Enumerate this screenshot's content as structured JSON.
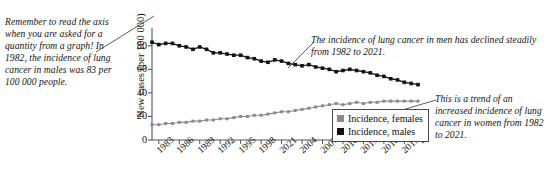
{
  "annotations": {
    "left_note": "Remember to read the axis when you are asked for a quantity from a graph! In 1982, the incidence of lung cancer in males was 83 per 100 000 people.",
    "men_note": "The incidence of lung cancer in men has declined steadily from 1982 to 2021.",
    "women_note": "This is a trend of an increased incidence of lung cancer in women from 1982 to 2021."
  },
  "legend": {
    "items": [
      {
        "label": "Incidence, females",
        "color": "#8a8a8a"
      },
      {
        "label": "Incidence, males",
        "color": "#111111"
      }
    ]
  },
  "chart_data": {
    "type": "line",
    "title": "",
    "xlabel": "",
    "ylabel": "New cases (per 100 000)",
    "ylim": [
      0,
      90
    ],
    "yticks": [
      0,
      20,
      40,
      60,
      80
    ],
    "grid": false,
    "legend_position": "inside-bottom-right",
    "x": [
      1982,
      1983,
      1984,
      1985,
      1986,
      1987,
      1988,
      1989,
      1990,
      1991,
      1992,
      1993,
      1994,
      1995,
      1996,
      1997,
      1998,
      1999,
      2000,
      2001,
      2002,
      2003,
      2004,
      2005,
      2006,
      2007,
      2008,
      2009,
      2010,
      2011,
      2012,
      2013,
      2014,
      2015,
      2016,
      2017,
      2018,
      2019,
      2020,
      2021
    ],
    "xtick_labels": [
      "1983",
      "1986",
      "1989",
      "1992",
      "1995",
      "1998",
      "2021",
      "2004",
      "2007",
      "2010",
      "2013",
      "2016",
      "2019"
    ],
    "xtick_values": [
      1983,
      1986,
      1989,
      1992,
      1995,
      1998,
      2001,
      2004,
      2007,
      2010,
      2013,
      2016,
      2019
    ],
    "series": [
      {
        "name": "Incidence, males",
        "color": "#111111",
        "values": [
          83,
          81,
          82,
          82,
          80,
          79,
          77,
          79,
          77,
          74,
          74,
          73,
          72,
          72,
          70,
          69,
          67,
          66,
          68,
          67,
          65,
          64,
          63,
          64,
          62,
          61,
          60,
          58,
          59,
          60,
          59,
          58,
          57,
          55,
          54,
          52,
          51,
          49,
          48,
          47
        ]
      },
      {
        "name": "Incidence, females",
        "color": "#8a8a8a",
        "values": [
          13,
          13,
          14,
          14,
          15,
          15,
          16,
          16,
          17,
          17,
          18,
          18,
          19,
          20,
          20,
          21,
          21,
          22,
          23,
          24,
          24,
          25,
          26,
          27,
          28,
          29,
          30,
          31,
          30,
          31,
          32,
          31,
          32,
          32,
          33,
          33,
          33,
          33,
          33,
          33
        ]
      }
    ]
  }
}
